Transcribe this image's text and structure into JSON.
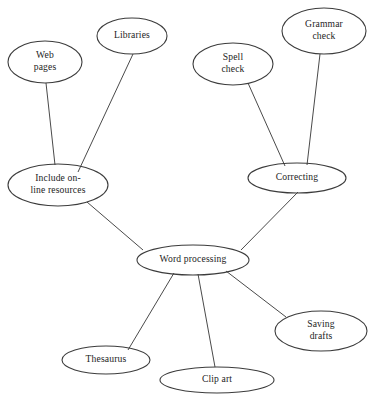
{
  "diagram": {
    "type": "concept-map",
    "background_color": "#ffffff",
    "node_stroke_color": "#3c3c3c",
    "edge_stroke_color": "#4a4a4a",
    "text_color": "#1d1d1d",
    "nodes": [
      {
        "id": "web-pages",
        "label": "Web pages",
        "lines": [
          "Web",
          "pages"
        ],
        "cx": 45,
        "cy": 62,
        "rx": 37,
        "ry": 21
      },
      {
        "id": "libraries",
        "label": "Libraries",
        "lines": [
          "Libraries"
        ],
        "cx": 132,
        "cy": 36,
        "rx": 35,
        "ry": 18
      },
      {
        "id": "spell-check",
        "label": "Spell check",
        "lines": [
          "Spell",
          "check"
        ],
        "cx": 233,
        "cy": 64,
        "rx": 40,
        "ry": 21
      },
      {
        "id": "grammar-check",
        "label": "Grammar check",
        "lines": [
          "Grammar",
          "check"
        ],
        "cx": 324,
        "cy": 31,
        "rx": 42,
        "ry": 23
      },
      {
        "id": "include-online-resources",
        "label": "Include on-line resources",
        "lines": [
          "Include on-",
          "line resources"
        ],
        "cx": 58,
        "cy": 185,
        "rx": 50,
        "ry": 21
      },
      {
        "id": "correcting",
        "label": "Correcting",
        "lines": [
          "Correcting"
        ],
        "cx": 297,
        "cy": 178,
        "rx": 49,
        "ry": 15
      },
      {
        "id": "word-processing",
        "label": "Word processing",
        "lines": [
          "Word processing"
        ],
        "cx": 193,
        "cy": 260,
        "rx": 56,
        "ry": 15
      },
      {
        "id": "thesaurus",
        "label": "Thesaurus",
        "lines": [
          "Thesaurus"
        ],
        "cx": 106,
        "cy": 360,
        "rx": 44,
        "ry": 14
      },
      {
        "id": "clip-art",
        "label": "Clip art",
        "lines": [
          "Clip art"
        ],
        "cx": 217,
        "cy": 380,
        "rx": 57,
        "ry": 13
      },
      {
        "id": "saving-drafts",
        "label": "Saving drafts",
        "lines": [
          "Saving",
          "drafts"
        ],
        "cx": 321,
        "cy": 331,
        "rx": 46,
        "ry": 20
      }
    ],
    "edges": [
      {
        "id": "web-pages--include",
        "from": "web-pages",
        "to": "include-online-resources",
        "x1": 46,
        "y1": 83,
        "x2": 55,
        "y2": 165
      },
      {
        "id": "libraries--include",
        "from": "libraries",
        "to": "include-online-resources",
        "x1": 133,
        "y1": 54,
        "x2": 78,
        "y2": 172
      },
      {
        "id": "spell-check--correcting",
        "from": "spell-check",
        "to": "correcting",
        "x1": 248,
        "y1": 83,
        "x2": 285,
        "y2": 166
      },
      {
        "id": "grammar-check--correcting",
        "from": "grammar-check",
        "to": "correcting",
        "x1": 320,
        "y1": 54,
        "x2": 307,
        "y2": 165
      },
      {
        "id": "include--word-processing",
        "from": "include-online-resources",
        "to": "word-processing",
        "x1": 87,
        "y1": 202,
        "x2": 143,
        "y2": 250
      },
      {
        "id": "correcting--word-processing",
        "from": "correcting",
        "to": "word-processing",
        "x1": 298,
        "y1": 192,
        "x2": 241,
        "y2": 250
      },
      {
        "id": "word-processing--thesaurus",
        "from": "word-processing",
        "to": "thesaurus",
        "x1": 174,
        "y1": 273,
        "x2": 128,
        "y2": 350
      },
      {
        "id": "word-processing--clip-art",
        "from": "word-processing",
        "to": "clip-art",
        "x1": 198,
        "y1": 274,
        "x2": 215,
        "y2": 367
      },
      {
        "id": "word-processing--saving-drafts",
        "from": "word-processing",
        "to": "saving-drafts",
        "x1": 226,
        "y1": 271,
        "x2": 286,
        "y2": 317
      }
    ]
  }
}
